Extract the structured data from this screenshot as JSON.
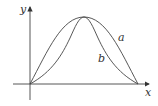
{
  "diagram": {
    "axes": {
      "x_label": "x",
      "y_label": "y"
    },
    "curves": [
      {
        "name": "a",
        "label": "a",
        "shape": "sine-like arch"
      },
      {
        "name": "b",
        "label": "b",
        "shape": "bell-like arch (squared sine)"
      }
    ],
    "colors": {
      "stroke": "#444444",
      "background": "#ffffff"
    }
  }
}
